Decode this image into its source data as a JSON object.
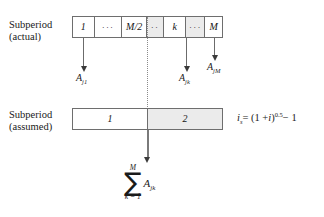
{
  "figure": {
    "type": "timeline-subperiod-diagram",
    "colors": {
      "background": "#ffffff",
      "bar_border": "#6e6e6e",
      "cell_shade": "#ebebeb",
      "arrow": "#6b6b6b",
      "text": "#1a1a1a",
      "dotted_divider": "#8a8a8a"
    }
  },
  "rows": {
    "actual": {
      "label_line1": "Subperiod",
      "label_line2": "(actual)",
      "cells": [
        {
          "id": "cell-1",
          "text": "1",
          "style": "plain",
          "kind": "value"
        },
        {
          "id": "cell-dots-1",
          "text": "···",
          "style": "plain",
          "kind": "ellipsis"
        },
        {
          "id": "cell-mhalf",
          "text": "M/2",
          "style": "plain",
          "kind": "value"
        },
        {
          "id": "cell-dots-2",
          "text": "··",
          "style": "shaded",
          "kind": "ellipsis"
        },
        {
          "id": "cell-k",
          "text": "k",
          "style": "plain",
          "kind": "value"
        },
        {
          "id": "cell-dots-3",
          "text": "···",
          "style": "shaded",
          "kind": "ellipsis"
        },
        {
          "id": "cell-m",
          "text": "M",
          "style": "plain",
          "kind": "value"
        }
      ]
    },
    "assumed": {
      "label_line1": "Subperiod",
      "label_line2": "(assumed)",
      "cells": [
        {
          "id": "assumed-cell-1",
          "text": "1",
          "style": "plain",
          "kind": "value"
        },
        {
          "id": "assumed-cell-2",
          "text": "2",
          "style": "shaded",
          "kind": "value"
        }
      ]
    }
  },
  "cashflow_labels": [
    {
      "id": "A-j1",
      "base": "A",
      "sub": "j1"
    },
    {
      "id": "A-jk",
      "base": "A",
      "sub": "jk"
    },
    {
      "id": "A-jM",
      "base": "A",
      "sub": "jM"
    }
  ],
  "formula": {
    "lhs_base": "i",
    "lhs_sub": "s",
    "eq": "= (1 +",
    "var": "i",
    "close": ")",
    "exponent": "0.5",
    "tail": "− 1",
    "full_text": "i_s = (1 + i)^0.5 − 1"
  },
  "summation": {
    "upper_limit": "M",
    "sigma": "∑",
    "lower_limit": "k = 1",
    "term_base": "A",
    "term_sub": "jk",
    "full_text": "sum from k=1 to M of A_jk"
  }
}
